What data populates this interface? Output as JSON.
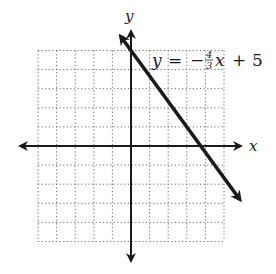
{
  "chart_data": {
    "type": "line",
    "title": "",
    "equation_label": "y = −4/3x + 5",
    "xlabel": "x",
    "ylabel": "y",
    "xlim": [
      -5,
      5
    ],
    "ylim": [
      -5,
      5
    ],
    "grid": true,
    "grid_style": "dotted",
    "tick_step": 1,
    "series": [
      {
        "name": "y = -4/3 x + 5",
        "slope": -1.3333,
        "intercept": 5,
        "x": [
          -0.5,
          0,
          3,
          3.75,
          6
        ],
        "y": [
          5.67,
          5,
          1,
          0,
          -3
        ]
      }
    ],
    "x_intercept": 3.75,
    "y_intercept": 5
  },
  "labels": {
    "x_axis": "x",
    "y_axis": "y",
    "eq_y": "y",
    "eq_equals": "=",
    "eq_minus": "−",
    "eq_num": "4",
    "eq_den": "3",
    "eq_x": "x",
    "eq_plus": "+",
    "eq_const": "5"
  },
  "colors": {
    "ink": "#1a1a1a",
    "grid": "#6b6b6b",
    "background": "#ffffff"
  }
}
